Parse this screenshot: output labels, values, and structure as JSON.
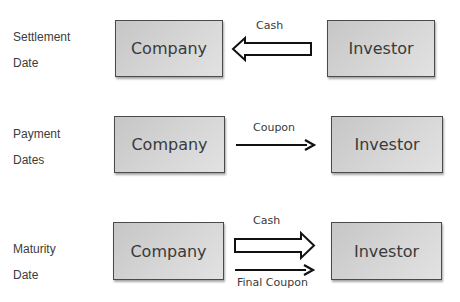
{
  "diagram": {
    "rows": [
      {
        "label_line1": "Settlement",
        "label_line2": "Date",
        "left_entity": "Company",
        "right_entity": "Investor",
        "flows": [
          {
            "label": "Cash",
            "direction": "investor-to-company",
            "style": "block-arrow"
          }
        ]
      },
      {
        "label_line1": "Payment",
        "label_line2": "Dates",
        "left_entity": "Company",
        "right_entity": "Investor",
        "flows": [
          {
            "label": "Coupon",
            "direction": "company-to-investor",
            "style": "line-arrow"
          }
        ]
      },
      {
        "label_line1": "Maturity",
        "label_line2": "Date",
        "left_entity": "Company",
        "right_entity": "Investor",
        "flows": [
          {
            "label": "Cash",
            "direction": "company-to-investor",
            "style": "block-arrow"
          },
          {
            "label": "Final Coupon",
            "direction": "company-to-investor",
            "style": "line-arrow"
          }
        ]
      }
    ],
    "colors": {
      "box_fill": "#d4d4d4",
      "box_border": "#4a4a4a",
      "text": "#3a3a3a",
      "arrow": "#111111"
    }
  }
}
